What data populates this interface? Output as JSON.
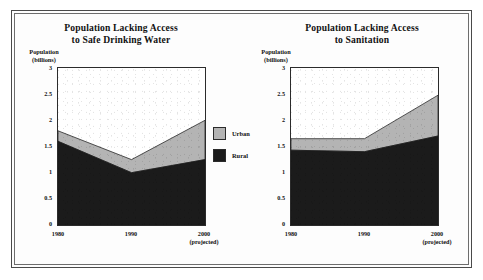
{
  "figure": {
    "background_color": "#ffffff",
    "frame_color": "#4a4a4a"
  },
  "legend": {
    "items": [
      {
        "label": "Urban",
        "color": "#b4b4b4"
      },
      {
        "label": "Rural",
        "color": "#1b1b1b"
      }
    ]
  },
  "chart_data": [
    {
      "type": "area",
      "stacked": true,
      "title": "Population Lacking Access to Safe Drinking Water",
      "title_line1": "Population Lacking Access",
      "title_line2": "to Safe Drinking Water",
      "ylabel": "Population (billions)",
      "ylabel_line1": "Population",
      "ylabel_line2": "(billions)",
      "xlabel": "",
      "x": [
        "1980",
        "1990",
        "2000"
      ],
      "x_tick_sublabels": [
        "",
        "",
        "(projected)"
      ],
      "ylim": [
        0,
        3
      ],
      "yticks": [
        0,
        0.5,
        1,
        1.5,
        2,
        2.5,
        3
      ],
      "ytick_labels": [
        "0",
        "0.5",
        "1",
        "1.5",
        "2",
        "2.5",
        "3"
      ],
      "grid": false,
      "legend_position": "outside-right",
      "series": [
        {
          "name": "Rural",
          "color": "#1b1b1b",
          "values": [
            1.6,
            1.0,
            1.25
          ]
        },
        {
          "name": "Urban",
          "color": "#b4b4b4",
          "values": [
            0.2,
            0.25,
            0.75
          ]
        }
      ],
      "totals": [
        1.8,
        1.25,
        2.0
      ]
    },
    {
      "type": "area",
      "stacked": true,
      "title": "Population Lacking Access to Sanitation",
      "title_line1": "Population Lacking Access",
      "title_line2": "to Sanitation",
      "ylabel": "Population (billions)",
      "ylabel_line1": "Population",
      "ylabel_line2": "(billions)",
      "xlabel": "",
      "x": [
        "1980",
        "1990",
        "2000"
      ],
      "x_tick_sublabels": [
        "",
        "",
        "(projected)"
      ],
      "ylim": [
        0,
        3
      ],
      "yticks": [
        0,
        0.5,
        1,
        1.5,
        2,
        2.5,
        3
      ],
      "ytick_labels": [
        "0",
        "0.5",
        "1",
        "1.5",
        "2",
        "2.5",
        "3"
      ],
      "grid": false,
      "legend_position": "outside-left",
      "series": [
        {
          "name": "Rural",
          "color": "#1b1b1b",
          "values": [
            1.43,
            1.4,
            1.7
          ]
        },
        {
          "name": "Urban",
          "color": "#b4b4b4",
          "values": [
            0.22,
            0.25,
            0.78
          ]
        }
      ],
      "totals": [
        1.65,
        1.65,
        2.48
      ]
    }
  ]
}
